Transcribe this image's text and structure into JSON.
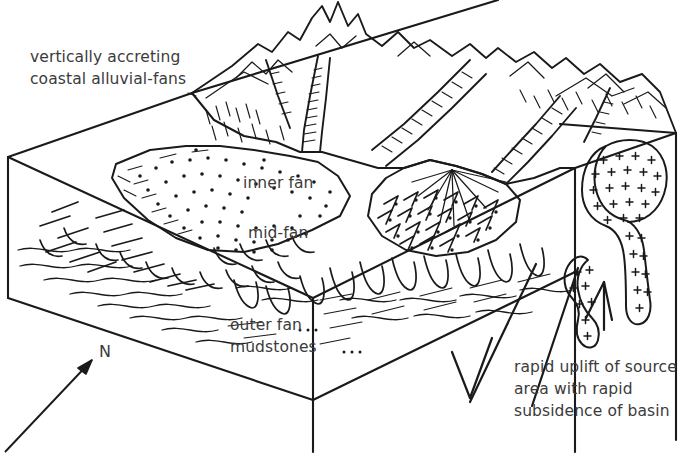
{
  "figure": {
    "background_color": "#ffffff",
    "ink_color": "#1a1a1a",
    "text_color": "#3b3b3b",
    "width": 690,
    "height": 457
  },
  "labels": {
    "top_left": {
      "line1": "vertically accreting",
      "line2": "coastal alluvial-fans"
    },
    "inner_fan": "inner fan",
    "mid_fan": "mid-fan",
    "outer_fan": {
      "line1": "outer fan",
      "line2": "mudstones"
    },
    "north": "N",
    "bottom_right": {
      "line1": "rapid uplift of source",
      "line2": "area with rapid",
      "line3": "subsidence of basin"
    }
  },
  "legend_symbols": {
    "north_arrow": "north-arrow",
    "fault_ticks": "normal-fault-half-arrows",
    "granite_fill": "plus-symbol-granite-pluton",
    "stipple_fill": "coarse-gravel-stipple",
    "hachure_fill": "canyon-hachure"
  }
}
